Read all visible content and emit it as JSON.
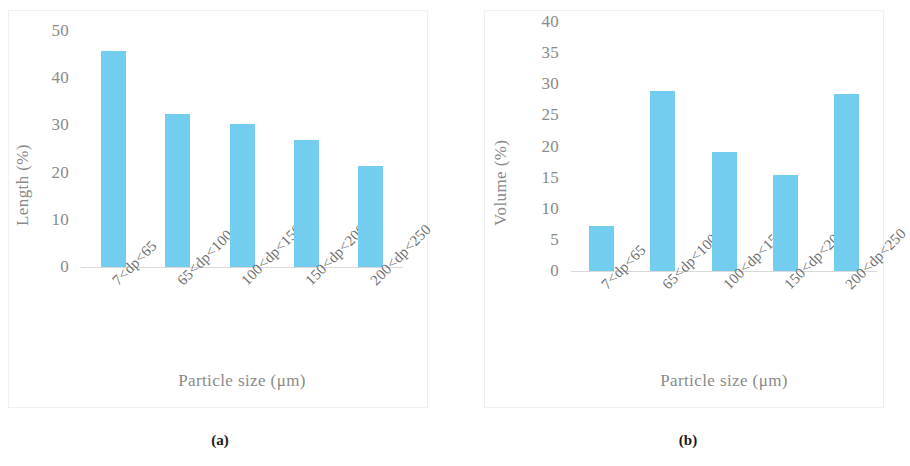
{
  "figure": {
    "panels": [
      {
        "id": "a",
        "caption": "(a)",
        "chart_data": {
          "type": "bar",
          "title": "",
          "xlabel": "Particle size (μm)",
          "ylabel": "Length (%)",
          "categories": [
            "7<dp<65",
            "65<dp<100",
            "100<dp<150",
            "150<dp<200",
            "200<dp<250"
          ],
          "values": [
            45.8,
            32.4,
            30.2,
            26.9,
            21.5
          ],
          "ylim": [
            0,
            50
          ],
          "yticks": [
            0,
            10,
            20,
            30,
            40,
            50
          ],
          "ytick_labels": [
            "0",
            "10",
            "20",
            "30",
            "40",
            "50"
          ],
          "grid": false,
          "legend": "none",
          "bar_color": "#72cdee"
        }
      },
      {
        "id": "b",
        "caption": "(b)",
        "chart_data": {
          "type": "bar",
          "title": "",
          "xlabel": "Particle size (μm)",
          "ylabel": "Volume (%)",
          "categories": [
            "7<dp<65",
            "65<dp<100",
            "100<dp<150",
            "150<dp<200",
            "200<dp<250"
          ],
          "values": [
            7.3,
            28.9,
            19.1,
            15.4,
            28.5
          ],
          "ylim": [
            0,
            40
          ],
          "yticks": [
            0,
            5,
            10,
            15,
            20,
            25,
            30,
            35,
            40
          ],
          "ytick_labels": [
            "0",
            "5",
            "10",
            "15",
            "20",
            "25",
            "30",
            "35",
            "40"
          ],
          "grid": false,
          "legend": "none",
          "bar_color": "#72cdee"
        }
      }
    ]
  },
  "colors": {
    "bar": "#72cdee",
    "axis": "#d9d9d9",
    "tick_text": "#8a8a8a",
    "caption_text": "#1a1a1a",
    "panel_border": "#f0f0f0",
    "background": "#ffffff"
  }
}
